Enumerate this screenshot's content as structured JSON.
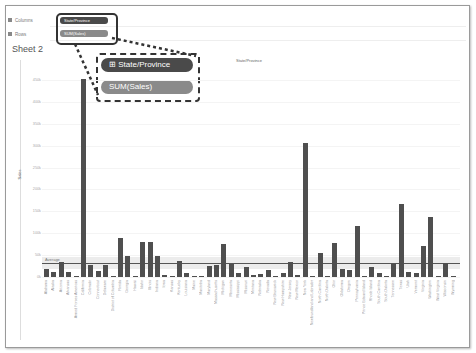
{
  "shelves": {
    "columns_label": "Columns",
    "rows_label": "Rows",
    "columns_pill": "State/Province",
    "rows_pill": "SUM(Sales)"
  },
  "callout": {
    "columns_pill": "State/Province",
    "rows_pill": "SUM(Sales)",
    "columns_color": "#4a4a4a",
    "rows_color": "#8a8a8a"
  },
  "sheet": {
    "title": "Sheet 2"
  },
  "chart_data": {
    "type": "bar",
    "title": "State/Province",
    "xlabel": "State/Province",
    "ylabel": "Sales",
    "ylim": [
      0,
      450000
    ],
    "y_ticks": [
      "0k",
      "50k",
      "100k",
      "150k",
      "200k",
      "250k",
      "300k",
      "350k",
      "400k",
      "450k"
    ],
    "reference_line": {
      "label": "Average",
      "value": 32000
    },
    "grid": true,
    "categories": [
      "Alabama",
      "Alaska",
      "Arizona",
      "Arkansas",
      "Armed Forces Americas",
      "California",
      "Colorado",
      "Connecticut",
      "Delaware",
      "District of Columbia",
      "Florida",
      "Georgia",
      "Hawaii",
      "Idaho",
      "Illinois",
      "Indiana",
      "Iowa",
      "Kansas",
      "Kentucky",
      "Louisiana",
      "Maine",
      "Manitoba",
      "Maryland",
      "Massachusetts",
      "Michigan",
      "Minnesota",
      "Mississippi",
      "Missouri",
      "Montana",
      "Nebraska",
      "Nevada",
      "New Brunswick",
      "New Hampshire",
      "New Jersey",
      "New Mexico",
      "New York",
      "Newfoundland and Labrador",
      "North Carolina",
      "North Dakota",
      "Ohio",
      "Oklahoma",
      "Oregon",
      "Pennsylvania",
      "Prince Edward Island",
      "Rhode Island",
      "South Carolina",
      "South Dakota",
      "Tennessee",
      "Texas",
      "Utah",
      "Vermont",
      "Virginia",
      "Washington",
      "West Virginia",
      "Wisconsin",
      "Wyoming"
    ],
    "values": [
      19000,
      11000,
      35000,
      11000,
      1000,
      452000,
      27000,
      13000,
      27000,
      2000,
      89000,
      49000,
      1000,
      79000,
      80000,
      49000,
      5000,
      3000,
      37000,
      9000,
      1000,
      1000,
      24000,
      27000,
      76000,
      30000,
      10000,
      23000,
      5000,
      7000,
      16000,
      1000,
      9000,
      35000,
      5000,
      307000,
      1000,
      55000,
      1000,
      78000,
      19000,
      17000,
      116000,
      2000,
      22000,
      8000,
      1000,
      30000,
      166000,
      11000,
      9000,
      70000,
      138000,
      1000,
      32000,
      2000
    ]
  }
}
